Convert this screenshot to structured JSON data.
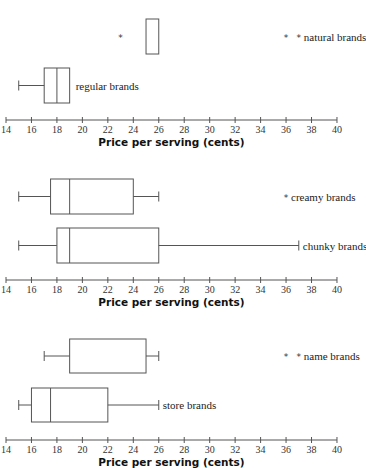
{
  "chart_data": [
    {
      "type": "boxplot",
      "title": "",
      "xlabel": "Price per serving (cents)",
      "ylabel": "",
      "xlim": [
        14,
        40
      ],
      "xticks": [
        14,
        16,
        18,
        20,
        22,
        24,
        26,
        28,
        30,
        32,
        34,
        36,
        38,
        40
      ],
      "grid": false,
      "series": [
        {
          "name": "natural brands",
          "min": 25,
          "q1": 25,
          "median": 25,
          "q3": 26,
          "max": 26,
          "outliers": [
            23,
            36,
            37
          ]
        },
        {
          "name": "regular brands",
          "min": 15,
          "q1": 17,
          "median": 18,
          "q3": 19,
          "max": 19,
          "outliers": []
        }
      ]
    },
    {
      "type": "boxplot",
      "title": "",
      "xlabel": "Price per serving (cents)",
      "ylabel": "",
      "xlim": [
        14,
        40
      ],
      "xticks": [
        14,
        16,
        18,
        20,
        22,
        24,
        26,
        28,
        30,
        32,
        34,
        36,
        38,
        40
      ],
      "grid": false,
      "series": [
        {
          "name": "creamy brands",
          "min": 15,
          "q1": 17.5,
          "median": 19,
          "q3": 24,
          "max": 26,
          "outliers": [
            36
          ]
        },
        {
          "name": "chunky brands",
          "min": 15,
          "q1": 18,
          "median": 19,
          "q3": 26,
          "max": 37,
          "outliers": []
        }
      ]
    },
    {
      "type": "boxplot",
      "title": "",
      "xlabel": "Price per serving (cents)",
      "ylabel": "",
      "xlim": [
        14,
        40
      ],
      "xticks": [
        14,
        16,
        18,
        20,
        22,
        24,
        26,
        28,
        30,
        32,
        34,
        36,
        38,
        40
      ],
      "grid": false,
      "series": [
        {
          "name": "name brands",
          "min": 17,
          "q1": 19,
          "median": 19,
          "q3": 25,
          "max": 26,
          "outliers": [
            36,
            37
          ]
        },
        {
          "name": "store brands",
          "min": 15,
          "q1": 16,
          "median": 17.5,
          "q3": 22,
          "max": 26,
          "outliers": []
        }
      ]
    }
  ],
  "layout": {
    "x0_value": 14,
    "x0_px": 6,
    "px_per_unit": 12.73,
    "stroke_color": "#555555",
    "panels": [
      {
        "axis_y": 120,
        "boxes": [
          {
            "top": 19,
            "bottom": 54,
            "show_whiskers": false,
            "label_mode": "right",
            "label_x": 0
          },
          {
            "top": 68,
            "bottom": 103,
            "show_whiskers": true,
            "label_mode": "after-box"
          }
        ]
      },
      {
        "axis_y": 280,
        "boxes": [
          {
            "top": 179,
            "bottom": 214,
            "show_whiskers": true,
            "label_mode": "right"
          },
          {
            "top": 228,
            "bottom": 263,
            "show_whiskers": true,
            "label_mode": "after-whisker"
          }
        ]
      },
      {
        "axis_y": 440,
        "boxes": [
          {
            "top": 339,
            "bottom": 373,
            "show_whiskers": true,
            "label_mode": "right"
          },
          {
            "top": 388,
            "bottom": 422,
            "show_whiskers": true,
            "label_mode": "after-whisker"
          }
        ]
      }
    ]
  }
}
